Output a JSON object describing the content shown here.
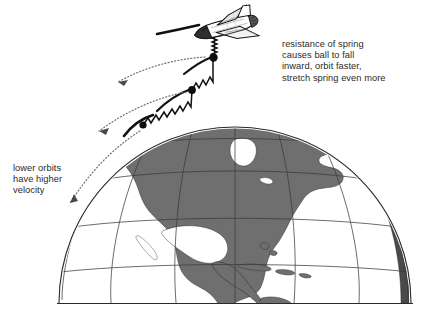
{
  "figure": {
    "kind": "physics-diagram",
    "background_color": "#ffffff",
    "ink_color": "#000000",
    "land_fill_color": "#6f6f6f",
    "text_color": "#2b2b2b"
  },
  "annotations": {
    "right_note": {
      "name": "spring-resistance-note",
      "lines": [
        "resistance of spring",
        "causes ball to fall",
        "inward, orbit faster,",
        "stretch spring even more"
      ],
      "text": "resistance of spring\ncauses ball to fall\ninward, orbit faster,\nstretch spring even more"
    },
    "left_note": {
      "name": "lower-orbit-velocity-note",
      "lines": [
        "lower orbits",
        "have higher",
        "velocity"
      ],
      "text": "lower orbits\nhave higher\nvelocity"
    }
  },
  "elements": {
    "shuttle": {
      "label": "space-shuttle",
      "x": 222,
      "y": 29
    },
    "tether": {
      "label": "tether-line"
    },
    "spring": {
      "label": "coil-spring"
    },
    "balls": [
      {
        "label": "tethered-ball-high",
        "x": 213,
        "y": 57
      },
      {
        "label": "tethered-ball-mid",
        "x": 192,
        "y": 90
      },
      {
        "label": "tethered-ball-low",
        "x": 143,
        "y": 125
      }
    ],
    "orbit_arrows": [
      {
        "label": "orbit-arrow-top"
      },
      {
        "label": "orbit-arrow-middle"
      },
      {
        "label": "orbit-arrow-bottom"
      }
    ],
    "earth": {
      "label": "earth-globe",
      "center_x": 235,
      "center_y": 332,
      "radius": 176,
      "horizon_y": 303,
      "graticule": "meridians-and-parallels",
      "landmass": "north-america"
    }
  }
}
